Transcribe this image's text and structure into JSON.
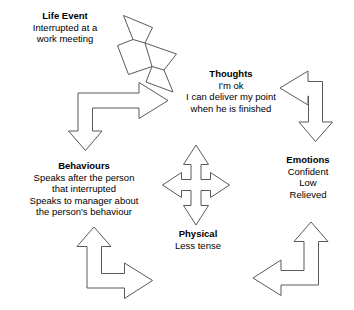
{
  "diagram": {
    "background_color": "#ffffff",
    "arrow_stroke_color": "#58595b",
    "arrow_fill_color": "#ffffff",
    "text_color": "#000000",
    "nodes": [
      {
        "id": "life-event",
        "title": "Life Event",
        "lines": [
          "Interrupted at a",
          "work meeting"
        ]
      },
      {
        "id": "thoughts",
        "title": "Thoughts",
        "lines": [
          "I'm ok",
          "I can deliver my point",
          "when he is finished"
        ]
      },
      {
        "id": "emotions",
        "title": "Emotions",
        "lines": [
          "Confident",
          "Low",
          "Relieved"
        ]
      },
      {
        "id": "physical",
        "title": "Physical",
        "lines": [
          "Less tense"
        ]
      },
      {
        "id": "behaviours",
        "title": "Behaviours",
        "lines": [
          "Speaks after the person",
          "that interrupted",
          "Speaks to manager about",
          "the person's behaviour"
        ]
      }
    ],
    "connectors": [
      {
        "id": "life-event-to-thoughts",
        "icon": "zigzag-arrow-up-right"
      },
      {
        "id": "life-event-to-behaviours",
        "icon": "elbow-arrow-right-down"
      },
      {
        "id": "thoughts-to-emotions",
        "icon": "elbow-arrow-left-down"
      },
      {
        "id": "behaviours-to-physical",
        "icon": "elbow-arrow-up-right"
      },
      {
        "id": "emotions-to-physical",
        "icon": "elbow-arrow-up-left"
      },
      {
        "id": "center-four-way",
        "icon": "four-way-arrow"
      }
    ]
  }
}
